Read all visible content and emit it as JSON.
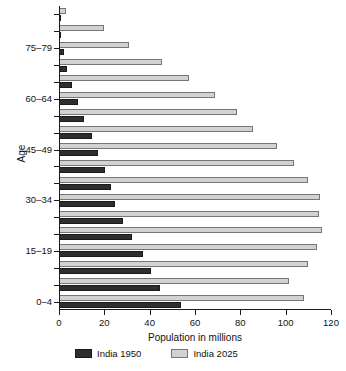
{
  "chart_data": {
    "type": "bar",
    "orientation": "horizontal",
    "title": "",
    "xlabel": "Population in millions",
    "ylabel": "Age",
    "xlim": [
      0,
      120
    ],
    "xticks": [
      0,
      20,
      40,
      60,
      80,
      100,
      120
    ],
    "xtick_labels": [
      "0",
      "20",
      "40",
      "60",
      "80",
      "100",
      "120"
    ],
    "grid": false,
    "legend_position": "bottom",
    "categories": [
      "85+",
      "80-84",
      "75-79",
      "70-74",
      "65-69",
      "60-64",
      "55-59",
      "50-54",
      "45-49",
      "40-44",
      "35-39",
      "30-34",
      "25-29",
      "20-24",
      "15-19",
      "10-14",
      "5-9",
      "0-4"
    ],
    "visible_ytick_labels": [
      "75-79",
      "60-64",
      "45-49",
      "30-34",
      "15-19",
      "0-4"
    ],
    "series": [
      {
        "name": "India 1950",
        "color": "#2e2e2e",
        "values": [
          0.4,
          1.0,
          2.0,
          3.6,
          5.8,
          8.4,
          11.2,
          14.4,
          17.4,
          20.5,
          23.0,
          24.6,
          28.2,
          32.0,
          37.0,
          40.4,
          44.6,
          54.0
        ]
      },
      {
        "name": "India 2025",
        "color": "#d2d2d2",
        "values": [
          3.0,
          20.0,
          31.0,
          45.5,
          57.5,
          69.0,
          78.5,
          85.5,
          96.0,
          103.5,
          110.0,
          115.0,
          114.5,
          116.0,
          114.0,
          110.0,
          101.5,
          108.0
        ]
      }
    ]
  },
  "legend": {
    "items": [
      {
        "label": "India 1950",
        "swatch": "dark"
      },
      {
        "label": "India 2025",
        "swatch": "light"
      }
    ]
  }
}
